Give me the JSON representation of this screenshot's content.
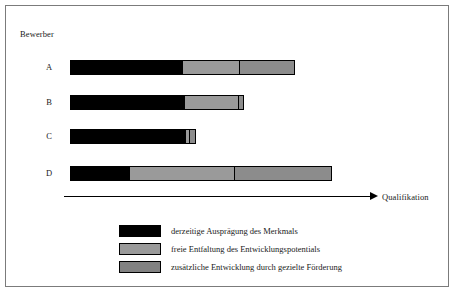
{
  "figure": {
    "y_axis_title": "Bewerber",
    "x_axis_title": "Qualifikation"
  },
  "colors": {
    "current": "#000000",
    "free_development": "#8e8e8e",
    "targeted_support": "#828282",
    "border": "#000000",
    "frame": "#7b7b7b",
    "background": "#ffffff"
  },
  "legend": {
    "items": [
      {
        "label": "derzeitige Ausprägung des Merkmals",
        "color": "#000000"
      },
      {
        "label": "freie Entfaltung des Entwicklungspotentials",
        "color": "#9a9a9a"
      },
      {
        "label": "zusätzliche Entwicklung durch gezielte Förderung",
        "color": "#828282"
      }
    ]
  },
  "chart_data": {
    "type": "bar",
    "orientation": "horizontal",
    "stacked": true,
    "title": "",
    "xlabel": "Qualifikation",
    "ylabel": "Bewerber",
    "grid": false,
    "legend_position": "bottom",
    "categories": [
      "A",
      "B",
      "C",
      "D"
    ],
    "series": [
      {
        "name": "derzeitige Ausprägung des Merkmals",
        "values": [
          111,
          113,
          114,
          58
        ]
      },
      {
        "name": "freie Entfaltung des Entwicklungspotentials",
        "values": [
          57,
          54,
          4,
          105
        ]
      },
      {
        "name": "zusätzliche Entwicklung durch gezielte Förderung",
        "values": [
          55,
          5,
          6,
          97
        ]
      }
    ],
    "axis_units": "px",
    "xlim": [
      0,
      308
    ],
    "note": "Segment lengths measured in pixels along the Qualifikation axis; axis is unscaled with no tick labels."
  },
  "bars": [
    {
      "label": "A",
      "top": 54,
      "left": 64,
      "segments": [
        {
          "name": "current",
          "width": 111,
          "color": "#000000"
        },
        {
          "name": "free",
          "width": 57,
          "color": "#9a9a9a"
        },
        {
          "name": "support",
          "width": 55,
          "color": "#8c8c8c"
        }
      ]
    },
    {
      "label": "B",
      "top": 89,
      "left": 64,
      "segments": [
        {
          "name": "current",
          "width": 113,
          "color": "#000000"
        },
        {
          "name": "free",
          "width": 54,
          "color": "#9a9a9a"
        },
        {
          "name": "support",
          "width": 5,
          "color": "#8c8c8c"
        }
      ]
    },
    {
      "label": "C",
      "top": 123,
      "left": 64,
      "segments": [
        {
          "name": "current",
          "width": 114,
          "color": "#000000"
        },
        {
          "name": "free",
          "width": 4,
          "color": "#9a9a9a"
        },
        {
          "name": "support",
          "width": 6,
          "color": "#8c8c8c"
        }
      ]
    },
    {
      "label": "D",
      "top": 160,
      "left": 64,
      "segments": [
        {
          "name": "current",
          "width": 58,
          "color": "#000000"
        },
        {
          "name": "free",
          "width": 105,
          "color": "#9a9a9a"
        },
        {
          "name": "support",
          "width": 97,
          "color": "#8c8c8c"
        }
      ]
    }
  ]
}
